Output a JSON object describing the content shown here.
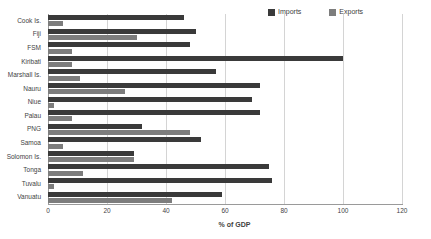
{
  "chart_data": {
    "type": "bar",
    "orientation": "horizontal",
    "title": "",
    "subtitle": "",
    "xlabel": "% of GDP",
    "ylabel": "",
    "xlim": [
      0,
      120
    ],
    "xticks": [
      0,
      20,
      40,
      60,
      80,
      100,
      120
    ],
    "xtick_labels": [
      "0",
      "20",
      "40",
      "60",
      "80",
      "100",
      "120"
    ],
    "grid": "vertical",
    "legend_position": "top-right",
    "categories": [
      "Cook Is.",
      "Fiji",
      "FSM",
      "Kiribati",
      "Marshall Is.",
      "Nauru",
      "Niue",
      "Palau",
      "PNG",
      "Samoa",
      "Solomon Is.",
      "Tonga",
      "Tuvalu",
      "Vanuatu"
    ],
    "series": [
      {
        "name": "Imports",
        "color": "#3a3a3a",
        "values": [
          46,
          50,
          48,
          100,
          57,
          72,
          69,
          72,
          32,
          52,
          29,
          75,
          76,
          59
        ]
      },
      {
        "name": "Exports",
        "color": "#7d7d7d",
        "values": [
          5,
          30,
          8,
          8,
          11,
          26,
          2,
          8,
          48,
          5,
          29,
          12,
          2,
          42
        ]
      }
    ]
  },
  "legend": {
    "entries": [
      {
        "label": "Imports",
        "color": "#3a3a3a",
        "swatch_name": "legend-swatch-imports"
      },
      {
        "label": "Exports",
        "color": "#7d7d7d",
        "swatch_name": "legend-swatch-exports"
      }
    ]
  }
}
